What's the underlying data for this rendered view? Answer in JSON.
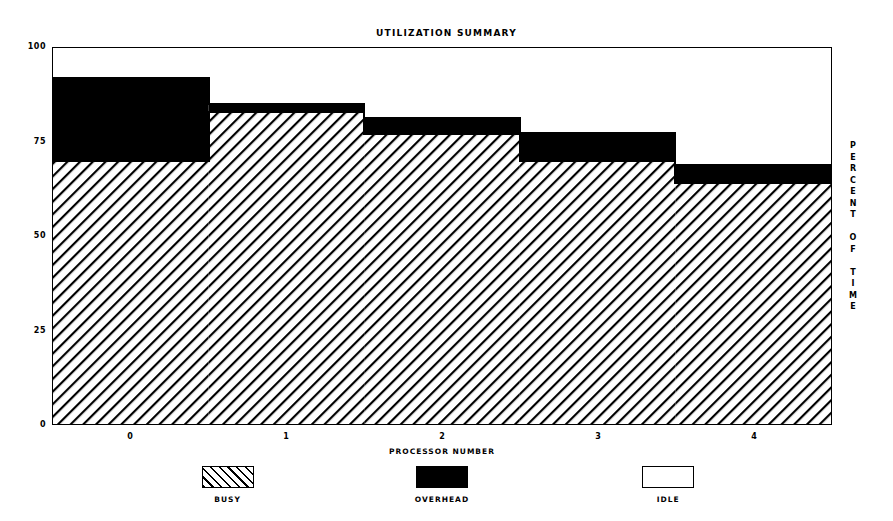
{
  "chart_data": {
    "type": "bar",
    "title": "UTILIZATION SUMMARY",
    "xlabel": "PROCESSOR NUMBER",
    "ylabel": "PERCENT OF TIME",
    "ylabel_stacked": "P\nE\nR\nC\nE\nN\nT\n\nO\nF\n\nT\nI\nM\nE",
    "categories": [
      "0",
      "1",
      "2",
      "3",
      "4"
    ],
    "xticklabels": [
      "0",
      "1",
      "2",
      "3",
      "4"
    ],
    "yticklabels": [
      "100",
      "75",
      "50",
      "25",
      "0"
    ],
    "ytickvalues": [
      100,
      75,
      50,
      25,
      0
    ],
    "ylim": [
      0,
      100
    ],
    "xlim": [
      -0.5,
      4.5
    ],
    "grid": false,
    "style": "stacked step / histogram bars",
    "legend_position": "below axes",
    "series": [
      {
        "name": "BUSY",
        "pattern": "diagonal-hatch",
        "values": [
          70,
          83,
          77,
          70,
          64
        ]
      },
      {
        "name": "OVERHEAD",
        "pattern": "solid-black",
        "values": [
          22,
          2,
          4.5,
          7.5,
          5
        ]
      },
      {
        "name": "IDLE",
        "pattern": "white-empty",
        "values": [
          8,
          15,
          18.5,
          22.5,
          31
        ]
      }
    ],
    "cumulative_tops": {
      "busy": [
        70,
        83,
        77,
        70,
        64
      ],
      "busy_plus_overhead": [
        92,
        85,
        81.5,
        77.5,
        69
      ],
      "total": [
        100,
        100,
        100,
        100,
        100
      ]
    }
  },
  "legend": {
    "entries": [
      {
        "label": "BUSY",
        "swatch": "hatch"
      },
      {
        "label": "OVERHEAD",
        "swatch": "solid"
      },
      {
        "label": "IDLE",
        "swatch": "empty"
      }
    ]
  },
  "colors": {
    "foreground": "#000000",
    "background": "#ffffff"
  }
}
